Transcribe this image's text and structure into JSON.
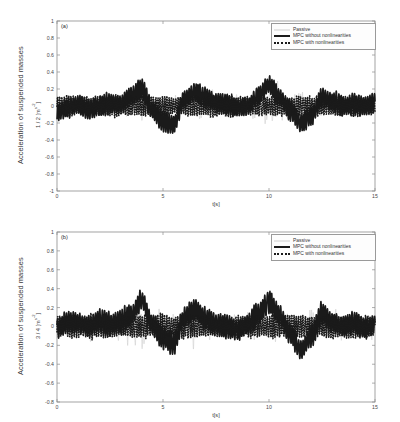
{
  "figure": {
    "background": "#ffffff",
    "axis_color": "#8c8c8c",
    "panels": [
      {
        "tag": "(a)",
        "ylabel_main": "Acceleration of suspended masses",
        "ylabel_unit_prefix": "1 / 2 [m",
        "ylabel_unit_sup": "s",
        "ylabel_unit_suffix": "]",
        "xlabel": "t[s]",
        "yticks": [
          "1",
          "0.8",
          "0.6",
          "0.4",
          "0.2",
          "0",
          "-0.2",
          "-0.4",
          "-0.6",
          "-0.8",
          "-1"
        ],
        "xticks": [
          "0",
          "5",
          "10",
          "15"
        ]
      },
      {
        "tag": "(b)",
        "ylabel_main": "Acceleration of suspended masses",
        "ylabel_unit_prefix": "3 / 4 [m",
        "ylabel_unit_sup": "s",
        "ylabel_unit_suffix": "]",
        "xlabel": "t[s]",
        "yticks": [
          "1",
          "0.8",
          "0.6",
          "0.4",
          "0.2",
          "0",
          "-0.2",
          "-0.4",
          "-0.6",
          "-0.8"
        ],
        "xticks": [
          "0",
          "5",
          "10",
          "15"
        ]
      }
    ],
    "legend": {
      "entries": [
        {
          "label": "Passive",
          "key": "thin-line-key",
          "color": "#cfcfcf"
        },
        {
          "label": "MPC without nonlinearities",
          "key": "thick-line-key",
          "color": "#1a1a1a"
        },
        {
          "label": "MPC with nonlinearities",
          "key": "dotted-line-key",
          "color": "#1a1a1a"
        }
      ]
    }
  },
  "chart_data": [
    {
      "type": "line",
      "panel": "(a)",
      "title": "",
      "xlabel": "t[s]",
      "ylabel": "Acceleration of suspended masses 1 / 2 [m s⁻²]",
      "xlim": [
        0,
        15
      ],
      "ylim": [
        -1,
        1
      ],
      "xticks": [
        0,
        5,
        10,
        15
      ],
      "yticks": [
        -1,
        -0.8,
        -0.6,
        -0.4,
        -0.2,
        0,
        0.2,
        0.4,
        0.6,
        0.8,
        1
      ],
      "grid": false,
      "legend_position": "upper-right",
      "series": [
        {
          "name": "Passive",
          "color": "#cfcfcf",
          "linewidth": 0.6,
          "style": "solid",
          "description": "Broadband high-amplitude random vibration signal, envelope roughly +/-0.6 with occasional spikes to +/-0.85",
          "envelope_amplitude": 0.55,
          "peak_amplitude": 0.88,
          "noise_seed": 11,
          "carrier_hz": 9.5,
          "x": [
            0,
            1,
            2,
            3,
            4,
            5,
            6,
            7,
            8,
            9,
            10,
            11,
            12,
            13,
            14,
            15
          ],
          "y_envelope": [
            0.45,
            0.5,
            0.55,
            0.6,
            0.75,
            0.62,
            0.55,
            0.6,
            0.5,
            0.58,
            0.8,
            0.62,
            0.58,
            0.65,
            0.55,
            0.5
          ]
        },
        {
          "name": "MPC without nonlinearities",
          "color": "#1a1a1a",
          "linewidth": 1.6,
          "style": "solid",
          "description": "Attenuated controlled acceleration, dense oscillation about a slowly varying trend between -0.45 and +0.5",
          "envelope_amplitude": 0.2,
          "peak_amplitude": 0.5,
          "noise_seed": 3,
          "carrier_hz": 9.5,
          "x": [
            0,
            0.5,
            1,
            1.5,
            2,
            2.5,
            3,
            3.5,
            4,
            4.5,
            5,
            5.5,
            6,
            6.5,
            7,
            7.5,
            8,
            8.5,
            9,
            9.5,
            10,
            10.5,
            11,
            11.5,
            12,
            12.5,
            13,
            13.5,
            14,
            14.5,
            15
          ],
          "y_trend": [
            -0.08,
            -0.02,
            0.02,
            -0.04,
            0.0,
            0.03,
            0.02,
            0.12,
            0.2,
            -0.05,
            -0.18,
            -0.22,
            0.08,
            0.16,
            0.1,
            0.04,
            0.02,
            -0.02,
            0.0,
            0.12,
            0.25,
            0.1,
            -0.05,
            -0.2,
            -0.12,
            0.1,
            0.05,
            0.0,
            0.02,
            0.0,
            0.04
          ]
        },
        {
          "name": "MPC with nonlinearities",
          "color": "#1a1a1a",
          "linewidth": 1.6,
          "style": "dotted",
          "description": "Nearly coincident with the MPC without nonlinearities trace; overlaps it across the full record",
          "envelope_amplitude": 0.2,
          "peak_amplitude": 0.5,
          "noise_seed": 4,
          "carrier_hz": 9.5
        }
      ]
    },
    {
      "type": "line",
      "panel": "(b)",
      "title": "",
      "xlabel": "t[s]",
      "ylabel": "Acceleration of suspended masses 3 / 4 [m s⁻²]",
      "xlim": [
        0,
        15
      ],
      "ylim": [
        -0.8,
        1
      ],
      "xticks": [
        0,
        5,
        10,
        15
      ],
      "yticks": [
        -0.8,
        -0.6,
        -0.4,
        -0.2,
        0,
        0.2,
        0.4,
        0.6,
        0.8,
        1
      ],
      "grid": false,
      "legend_position": "upper-right",
      "series": [
        {
          "name": "Passive",
          "color": "#cfcfcf",
          "linewidth": 0.6,
          "style": "solid",
          "description": "Broadband random vibration, envelope roughly +/-0.55 with spikes near t=4.2 reaching +0.95 and dips to -0.7",
          "envelope_amplitude": 0.5,
          "peak_amplitude": 0.95,
          "noise_seed": 21,
          "carrier_hz": 9.5,
          "x": [
            0,
            1,
            2,
            3,
            4,
            5,
            6,
            7,
            8,
            9,
            10,
            11,
            12,
            13,
            14,
            15
          ],
          "y_envelope": [
            0.4,
            0.45,
            0.5,
            0.55,
            0.9,
            0.6,
            0.5,
            0.55,
            0.48,
            0.5,
            0.62,
            0.55,
            0.62,
            0.6,
            0.5,
            0.45
          ]
        },
        {
          "name": "MPC without nonlinearities",
          "color": "#1a1a1a",
          "linewidth": 1.6,
          "style": "solid",
          "description": "Attenuated controlled acceleration oscillating between -0.45 and +0.55 with a peak near t=4.2",
          "envelope_amplitude": 0.2,
          "peak_amplitude": 0.55,
          "noise_seed": 7,
          "carrier_hz": 9.5,
          "x": [
            0,
            0.5,
            1,
            1.5,
            2,
            2.5,
            3,
            3.5,
            4,
            4.5,
            5,
            5.5,
            6,
            6.5,
            7,
            7.5,
            8,
            8.5,
            9,
            9.5,
            10,
            10.5,
            11,
            11.5,
            12,
            12.5,
            13,
            13.5,
            14,
            14.5,
            15
          ],
          "y_trend": [
            -0.02,
            0.05,
            0.04,
            0.0,
            0.06,
            0.02,
            0.05,
            0.12,
            0.28,
            0.02,
            -0.12,
            -0.18,
            0.1,
            0.18,
            0.08,
            0.02,
            0.0,
            -0.04,
            0.02,
            0.14,
            0.26,
            0.12,
            -0.08,
            -0.25,
            -0.1,
            0.14,
            0.04,
            0.0,
            0.04,
            -0.02,
            0.02
          ]
        },
        {
          "name": "MPC with nonlinearities",
          "color": "#1a1a1a",
          "linewidth": 1.6,
          "style": "dotted",
          "description": "Overlaps the MPC without nonlinearities trace throughout the record",
          "envelope_amplitude": 0.2,
          "peak_amplitude": 0.55,
          "noise_seed": 8,
          "carrier_hz": 9.5
        }
      ]
    }
  ]
}
